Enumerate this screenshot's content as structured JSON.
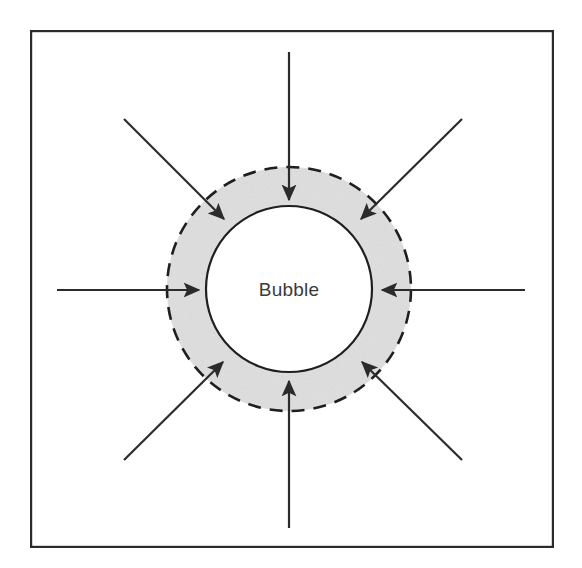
{
  "figure": {
    "kind": "schematic-diagram",
    "title_text": "",
    "background_color": "#ffffff",
    "frame": {
      "name": "outer-border",
      "x": 30,
      "y": 30,
      "width": 524,
      "height": 518,
      "stroke_color": "#2b2b2b",
      "stroke_width": 2.2,
      "fill": "none"
    },
    "center": {
      "x": 289,
      "y": 289
    },
    "shell": {
      "label": "Bubble",
      "outer_circle": {
        "name": "bubble-outer-dashed-circle",
        "radius": 122,
        "stroke_color": "#1f1f1f",
        "stroke_width": 2.6,
        "dash_pattern": "13 9",
        "style": "dashed"
      },
      "inner_circle": {
        "name": "bubble-inner-solid-circle",
        "radius": 83,
        "stroke_color": "#1f1f1f",
        "stroke_width": 2.2,
        "style": "solid",
        "fill": "#ffffff"
      },
      "annulus_fill_color": "#e6e6e6",
      "annulus_texture": "speckled-gray"
    },
    "arrows": {
      "count": 8,
      "direction": "inward",
      "stroke_color": "#2b2b2b",
      "stroke_width": 2.2,
      "head_length": 19,
      "head_width": 13,
      "items": [
        {
          "name": "arrow-north",
          "label": "top",
          "angle_deg": 270,
          "tail": {
            "x": 289,
            "y": 52
          },
          "tip": {
            "x": 289,
            "y": 200
          }
        },
        {
          "name": "arrow-south",
          "label": "bottom",
          "angle_deg": 90,
          "tail": {
            "x": 289,
            "y": 528
          },
          "tip": {
            "x": 289,
            "y": 381
          }
        },
        {
          "name": "arrow-west",
          "label": "left",
          "angle_deg": 0,
          "tail": {
            "x": 57,
            "y": 290
          },
          "tip": {
            "x": 199,
            "y": 290
          }
        },
        {
          "name": "arrow-east",
          "label": "right",
          "angle_deg": 180,
          "tail": {
            "x": 525,
            "y": 290
          },
          "tip": {
            "x": 382,
            "y": 290
          }
        },
        {
          "name": "arrow-northwest",
          "label": "top-left",
          "angle_deg": 315,
          "tail": {
            "x": 124,
            "y": 119
          },
          "tip": {
            "x": 224,
            "y": 219
          }
        },
        {
          "name": "arrow-northeast",
          "label": "top-right",
          "angle_deg": 225,
          "tail": {
            "x": 462,
            "y": 119
          },
          "tip": {
            "x": 361,
            "y": 219
          }
        },
        {
          "name": "arrow-southwest",
          "label": "bottom-left",
          "angle_deg": 45,
          "tail": {
            "x": 124,
            "y": 460
          },
          "tip": {
            "x": 223,
            "y": 362
          }
        },
        {
          "name": "arrow-southeast",
          "label": "bottom-right",
          "angle_deg": 135,
          "tail": {
            "x": 462,
            "y": 460
          },
          "tip": {
            "x": 362,
            "y": 362
          }
        }
      ]
    }
  }
}
